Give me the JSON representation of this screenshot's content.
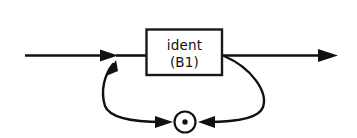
{
  "diagram": {
    "type": "railroad-syntax-diagram",
    "background_color": "#ffffff",
    "line_color": "#111111",
    "box_fill_color": "#ffffff",
    "entry": {
      "name": "entry-rail",
      "arrow": "right-arrow"
    },
    "exit": {
      "name": "exit-rail",
      "arrow": "right-arrow"
    },
    "terminal_box": {
      "label_line_1": "ident",
      "label_line_2": "(B1)",
      "x": 146,
      "y": 29,
      "width": 76,
      "height": 46
    },
    "separator_node": {
      "symbol": "dot",
      "glyph": "·",
      "cx": 185,
      "cy": 122,
      "radius": 10.5,
      "dot_radius": 2.6
    },
    "loop": {
      "name": "repetition-loop",
      "direction": "right-to-left",
      "left_arrow": "up-left-arrow",
      "right_arrow": "left-arrow",
      "bottom_arrow": "right-arrow"
    }
  }
}
